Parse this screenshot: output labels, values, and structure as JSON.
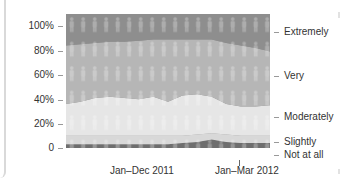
{
  "chart_data": {
    "type": "area",
    "stacked": true,
    "title": "",
    "xlabel": "",
    "ylabel": "",
    "ylim": [
      0,
      100
    ],
    "y_ticks": [
      "100%",
      "80%",
      "60%",
      "40%",
      "20%",
      "0"
    ],
    "x_tick_labels": [
      "Jan–Dec 2011",
      "Jan–Mar 2012"
    ],
    "x": [
      0,
      1,
      2,
      3,
      4,
      5,
      6,
      7,
      8,
      9,
      10,
      11,
      12,
      13,
      14
    ],
    "series": [
      {
        "name": "Not at all",
        "color": "#6e6e6e",
        "values": [
          3,
          3,
          3,
          3,
          3,
          3,
          3,
          3,
          4,
          5,
          7,
          5,
          4,
          4,
          4
        ]
      },
      {
        "name": "Slightly",
        "color": "#d8d8d8",
        "values": [
          7,
          7,
          7,
          7,
          7,
          7,
          7,
          7,
          6,
          6,
          5,
          6,
          6,
          6,
          6
        ]
      },
      {
        "name": "Moderately",
        "color": "#e6e6e6",
        "values": [
          26,
          28,
          31,
          32,
          31,
          30,
          32,
          28,
          33,
          33,
          30,
          25,
          24,
          24,
          25
        ]
      },
      {
        "name": "Very",
        "color": "#b6b6b6",
        "values": [
          48,
          47,
          45,
          45,
          46,
          48,
          47,
          51,
          46,
          45,
          47,
          50,
          50,
          48,
          44
        ]
      },
      {
        "name": "Extremely",
        "color": "#8e8e8e",
        "values": [
          16,
          15,
          14,
          13,
          13,
          12,
          11,
          11,
          11,
          11,
          11,
          14,
          16,
          18,
          21
        ]
      }
    ],
    "legend_position": "right",
    "grid": false
  },
  "axis": {
    "y_labels": [
      "100%",
      "80%",
      "60%",
      "40%",
      "20%",
      "0"
    ],
    "x_labels": [
      "Jan–Dec 2011",
      "Jan–Mar 2012"
    ]
  },
  "legend": [
    "Extremely",
    "Very",
    "Moderately",
    "Slightly",
    "Not at all"
  ]
}
